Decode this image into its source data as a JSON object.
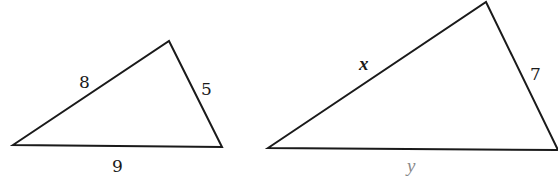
{
  "figure": {
    "stroke_color": "#1a1a1a",
    "triangles": [
      {
        "id": "small",
        "vertices": [
          [
            13,
            145
          ],
          [
            169,
            41
          ],
          [
            222,
            147
          ]
        ],
        "labels": {
          "left_side": "8",
          "right_side": "5",
          "bottom_side": "9"
        }
      },
      {
        "id": "large",
        "vertices": [
          [
            268,
            148
          ],
          [
            486,
            2
          ],
          [
            558,
            150
          ]
        ],
        "labels": {
          "left_side": "x",
          "right_side": "7",
          "bottom_side": "y"
        }
      }
    ]
  }
}
